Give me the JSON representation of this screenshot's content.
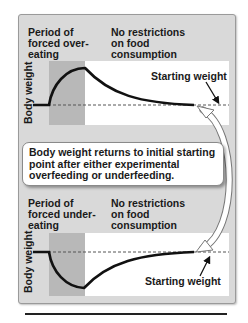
{
  "diagram": {
    "colors": {
      "frame_bg": "#d9d9d9",
      "forced_period_shade": "#b8b8b8",
      "plot_bg": "#ffffff",
      "curve": "#111111"
    },
    "top_panel": {
      "period_label": "Period of\nforced over-\neating",
      "free_label": "No restrictions\non food\nconsumption",
      "y_axis_label": "Body weight",
      "starting_weight_label": "Starting weight",
      "curve_description": "weight rises during forced overeating, then declines back to starting weight"
    },
    "callout": {
      "text": "Body weight returns to initial starting point after either experimental overfeeding or underfeeding."
    },
    "bottom_panel": {
      "period_label": "Period of\nforced under-\neating",
      "free_label": "No restrictions\non food\nconsumption",
      "y_axis_label": "Body weight",
      "starting_weight_label": "Starting weight",
      "curve_description": "weight falls during forced undereating, then rises back to starting weight"
    }
  }
}
